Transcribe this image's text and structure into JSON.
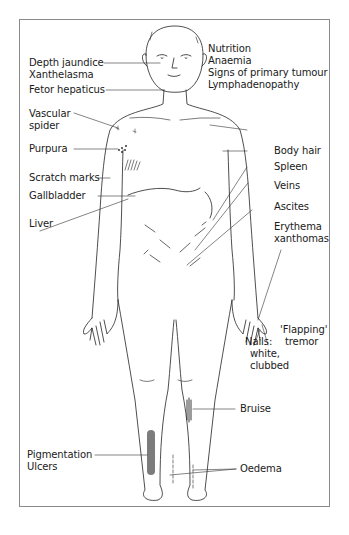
{
  "figure": {
    "labels_left": [
      {
        "id": "depth-jaundice",
        "text": "Depth jaundice"
      },
      {
        "id": "xanthelasma",
        "text": "Xanthelasma"
      },
      {
        "id": "fetor-hepaticus",
        "text": "Fetor hepaticus"
      },
      {
        "id": "vascular-spider-1",
        "text": "Vascular"
      },
      {
        "id": "vascular-spider-2",
        "text": "spider"
      },
      {
        "id": "purpura",
        "text": "Purpura"
      },
      {
        "id": "scratch-marks",
        "text": "Scratch marks"
      },
      {
        "id": "gallbladder",
        "text": "Gallbladder"
      },
      {
        "id": "liver",
        "text": "Liver"
      },
      {
        "id": "pigmentation",
        "text": "Pigmentation"
      },
      {
        "id": "ulcers",
        "text": "Ulcers"
      }
    ],
    "labels_right": [
      {
        "id": "nutrition",
        "text": "Nutrition"
      },
      {
        "id": "anaemia",
        "text": "Anaemia"
      },
      {
        "id": "primary-tumour",
        "text": "Signs of primary tumour"
      },
      {
        "id": "lymphadenopathy",
        "text": "Lymphadenopathy"
      },
      {
        "id": "body-hair",
        "text": "Body hair"
      },
      {
        "id": "spleen",
        "text": "Spleen"
      },
      {
        "id": "veins",
        "text": "Veins"
      },
      {
        "id": "ascites",
        "text": "Ascites"
      },
      {
        "id": "erythema-1",
        "text": "Erythema"
      },
      {
        "id": "erythema-2",
        "text": "xanthomas"
      },
      {
        "id": "flapping-1",
        "text": "'Flapping'"
      },
      {
        "id": "flapping-2",
        "text": "tremor"
      },
      {
        "id": "nails-1",
        "text": "Nails:"
      },
      {
        "id": "nails-2",
        "text": "white,"
      },
      {
        "id": "nails-3",
        "text": "clubbed"
      },
      {
        "id": "bruise",
        "text": "Bruise"
      },
      {
        "id": "oedema",
        "text": "Oedema"
      }
    ]
  }
}
